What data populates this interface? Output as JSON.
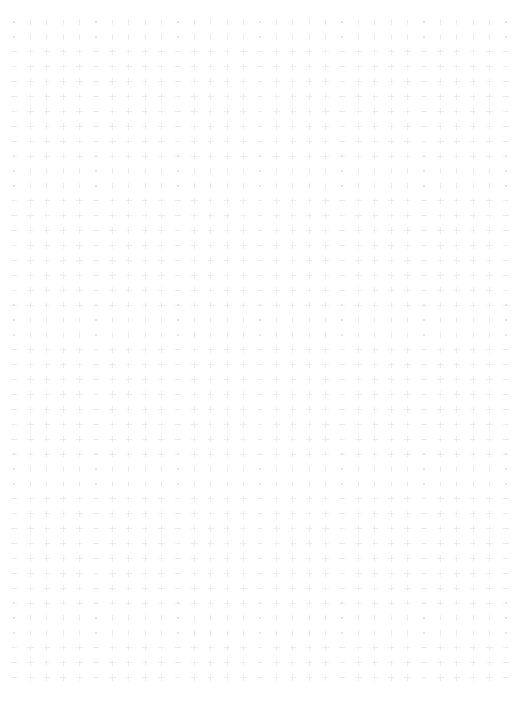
{
  "canvas": {
    "width": 518,
    "height": 714,
    "background_color": "#ffffff",
    "surface_type": "dot-grid",
    "content": "",
    "has_text": false,
    "has_ui_chrome": false
  },
  "grid": {
    "columns": 31,
    "rows": 45,
    "pitch_x": 16.4,
    "pitch_y": 14.9,
    "origin_x": 14,
    "origin_y": 22,
    "margin_left": 14,
    "margin_top": 22,
    "margin_right": 13,
    "margin_bottom": 30,
    "mark_shape": "cross-dot",
    "mark_color": "#ededf0",
    "mark_color_alt": "#f2f2f5",
    "mark_core_color": "#e4e4e9",
    "mark_size": 3.2,
    "mark_core_size": 1.3,
    "mark_opacity": 0.9
  }
}
